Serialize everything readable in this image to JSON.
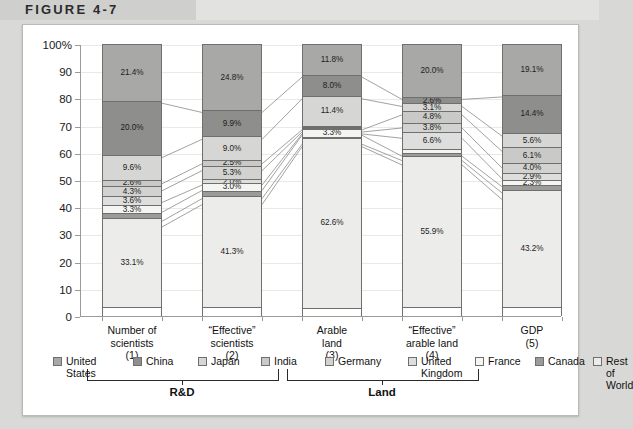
{
  "figure": {
    "title": "FIGURE 4-7"
  },
  "chart_data": {
    "type": "bar",
    "subtype": "stacked-100-percent",
    "title": "FIGURE 4-7",
    "xlabel": "",
    "ylabel": "",
    "ylim": [
      0,
      100
    ],
    "ytick_labels": [
      "100%",
      "90",
      "80",
      "70",
      "60",
      "50",
      "40",
      "30",
      "20",
      "10",
      "0"
    ],
    "yticks": [
      100,
      90,
      80,
      70,
      60,
      50,
      40,
      30,
      20,
      10,
      0
    ],
    "grid": true,
    "legend_position": "bottom",
    "categories": [
      "Number of scientists (1)",
      "“Effective” scientists (2)",
      "Arable land (3)",
      "“Effective” arable land (4)",
      "GDP (5)"
    ],
    "series": [
      {
        "name": "United States",
        "values": [
          21.4,
          24.8,
          11.8,
          20.0,
          19.1
        ]
      },
      {
        "name": "China",
        "values": [
          20.0,
          9.9,
          8.0,
          2.6,
          14.4
        ]
      },
      {
        "name": "Japan",
        "values": [
          9.6,
          9.0,
          11.4,
          3.1,
          5.6
        ]
      },
      {
        "name": "India",
        "values": [
          2.6,
          2.5,
          0.8,
          4.8,
          6.1
        ]
      },
      {
        "name": "Germany",
        "values": [
          4.3,
          5.3,
          0.7,
          3.8,
          4.0
        ]
      },
      {
        "name": "United Kingdom",
        "values": [
          3.6,
          2.0,
          0.5,
          6.6,
          2.9
        ]
      },
      {
        "name": "France",
        "values": [
          3.3,
          3.0,
          3.3,
          1.6,
          2.3
        ]
      },
      {
        "name": "Canada",
        "values": [
          2.1,
          2.2,
          0.9,
          1.6,
          2.4
        ]
      },
      {
        "name": "Rest of World",
        "values": [
          33.1,
          41.3,
          62.6,
          55.9,
          43.2
        ]
      }
    ],
    "bar_labels": [
      [
        "21.4%",
        "20.0%",
        "9.6%",
        "2.6%",
        "4.3%",
        "3.6%",
        "3.3%",
        "",
        "33.1%"
      ],
      [
        "24.8%",
        "9.9%",
        "9.0%",
        "2.5%",
        "5.3%",
        "2.0%",
        "3.0%",
        "",
        "41.3%"
      ],
      [
        "11.8%",
        "8.0%",
        "11.4%",
        "",
        "",
        "",
        "3.3%",
        "",
        "62.6%"
      ],
      [
        "20.0%",
        "2.6%",
        "3.1%",
        "4.8%",
        "3.8%",
        "6.6%",
        "",
        "",
        "55.9%"
      ],
      [
        "19.1%",
        "14.4%",
        "5.6%",
        "6.1%",
        "4.0%",
        "2.9%",
        "2.3%",
        "",
        "43.2%"
      ]
    ],
    "series_colors": [
      "#a8a8a6",
      "#8e8e8c",
      "#d6d6d4",
      "#c9c9c7",
      "#d2d2d0",
      "#dedede",
      "#f4f4f2",
      "#9b9b99",
      "#ececea"
    ],
    "legend": [
      "United States",
      "China",
      "Japan",
      "India",
      "Germany",
      "United Kingdom",
      "France",
      "Canada",
      "Rest of World"
    ]
  },
  "xaxis": {
    "categories": [
      {
        "line1": "Number of",
        "line2": "scientists",
        "line3": "(1)"
      },
      {
        "line1": "“Effective”",
        "line2": "scientists",
        "line3": "(2)"
      },
      {
        "line1": "Arable",
        "line2": "land",
        "line3": "(3)"
      },
      {
        "line1": "“Effective”",
        "line2": "arable land",
        "line3": "(4)"
      },
      {
        "line1": "GDP",
        "line2": "(5)",
        "line3": ""
      }
    ],
    "groups": [
      {
        "label": "R&D"
      },
      {
        "label": "Land"
      }
    ]
  },
  "legend": {
    "items": [
      {
        "line1": "United",
        "line2": "States"
      },
      {
        "line1": "China",
        "line2": ""
      },
      {
        "line1": "Japan",
        "line2": ""
      },
      {
        "line1": "India",
        "line2": ""
      },
      {
        "line1": "Germany",
        "line2": ""
      },
      {
        "line1": "United",
        "line2": "Kingdom"
      },
      {
        "line1": "France",
        "line2": ""
      },
      {
        "line1": "Canada",
        "line2": ""
      },
      {
        "line1": "Rest of",
        "line2": "World"
      }
    ]
  }
}
